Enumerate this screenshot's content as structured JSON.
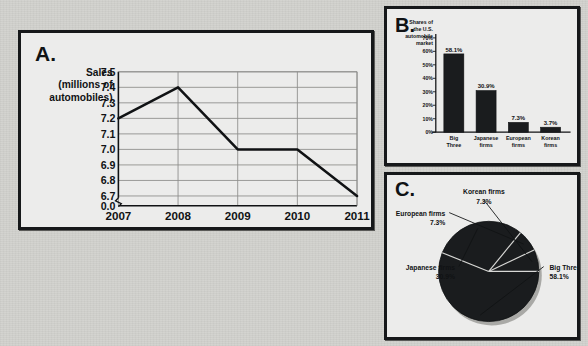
{
  "panels": {
    "a": {
      "letter": "A."
    },
    "b": {
      "letter": "B."
    },
    "c": {
      "letter": "C."
    }
  },
  "chart_data": [
    {
      "id": "panel-a",
      "type": "line",
      "title": "",
      "ylabel_lines": [
        "Sales",
        "(millions of",
        "automobiles)"
      ],
      "xlabel": "",
      "categories": [
        "2007",
        "2008",
        "2009",
        "2010",
        "2011"
      ],
      "x": [
        2007,
        2008,
        2009,
        2010,
        2011
      ],
      "values": [
        7.2,
        7.4,
        7.0,
        7.0,
        6.7
      ],
      "yticks": [
        "7.5",
        "7.4",
        "7.3",
        "7.2",
        "7.1",
        "7.0",
        "6.9",
        "6.8",
        "6.7",
        "0.0"
      ],
      "ytick_values": [
        7.5,
        7.4,
        7.3,
        7.2,
        7.1,
        7.0,
        6.9,
        6.8,
        6.7,
        0.0
      ],
      "ylim": [
        6.65,
        7.5
      ],
      "axis_break": true,
      "grid": true,
      "legend": "none"
    },
    {
      "id": "panel-b",
      "type": "bar",
      "title": "",
      "ylabel_lines": [
        "Shares of",
        "the U.S.",
        "automobile",
        "market"
      ],
      "xlabel": "",
      "categories": [
        "Big Three",
        "Japanese firms",
        "European firms",
        "Korean firms"
      ],
      "category_lines": [
        [
          "Big",
          "Three"
        ],
        [
          "Japanese",
          "firms"
        ],
        [
          "European",
          "firms"
        ],
        [
          "Korean",
          "firms"
        ]
      ],
      "values": [
        58.1,
        30.9,
        7.3,
        3.7
      ],
      "data_labels": [
        "58.1%",
        "30.9%",
        "7.3%",
        "3.7%"
      ],
      "yticks": [
        "70%",
        "60%",
        "50%",
        "40%",
        "30%",
        "20%",
        "10%",
        "0%"
      ],
      "ytick_values": [
        70,
        60,
        50,
        40,
        30,
        20,
        10,
        0
      ],
      "ylim": [
        0,
        70
      ],
      "grid": false,
      "legend": "none",
      "bar_color": "#1a1c1e"
    },
    {
      "id": "panel-c",
      "type": "pie",
      "title": "",
      "labels": [
        "Big Three",
        "Japanese firms",
        "European firms",
        "Korean firms"
      ],
      "values": [
        58.1,
        30.9,
        7.3,
        7.3
      ],
      "data_labels": [
        "58.1%",
        "30.9%",
        "7.3%",
        "7.3%"
      ],
      "label_texts": [
        [
          "Big Three",
          "58.1%"
        ],
        [
          "Japanese firms",
          "30.9%"
        ],
        [
          "European firms",
          "7.3%"
        ],
        [
          "Korean firms",
          "7.3%"
        ]
      ],
      "legend": "callout-labels",
      "slice_color": "#1a1c1e"
    }
  ],
  "colors": {
    "page_background": "#d2d2ce",
    "panel_background": "#ececeb",
    "ink": "#101214",
    "fill": "#1a1c1e",
    "grid": "#8d8d8b"
  }
}
